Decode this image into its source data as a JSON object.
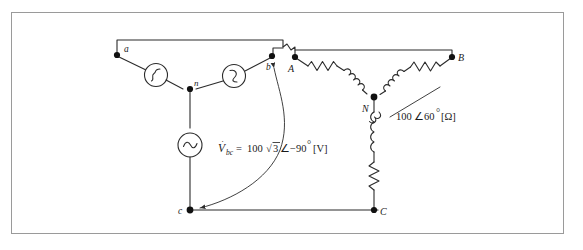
{
  "figure": {
    "type": "electrical-circuit-schematic",
    "corner_note": ""
  },
  "source_side": {
    "nodes": [
      {
        "id": "a",
        "label": "a"
      },
      {
        "id": "b",
        "label": "b"
      },
      {
        "id": "c",
        "label": "c"
      },
      {
        "id": "n",
        "label": "n"
      }
    ],
    "sources": [
      {
        "name": "source-a-n",
        "symbol": "ac-source"
      },
      {
        "name": "source-b-n",
        "symbol": "ac-source"
      },
      {
        "name": "source-c-n",
        "symbol": "ac-sine-source"
      }
    ],
    "voltage_label": "V̇bc = 100√3∠−90° [V]",
    "voltage_parts": {
      "symbol": "V",
      "dot": "̇",
      "subscript": "bc",
      "equals": "=",
      "magnitude": "100",
      "radical": "√",
      "radicand": "3",
      "angle_sign": "∠",
      "angle": "−90",
      "degree": "°",
      "unit": "[V]"
    }
  },
  "load_side": {
    "nodes": [
      {
        "id": "A",
        "label": "A"
      },
      {
        "id": "B",
        "label": "B"
      },
      {
        "id": "C",
        "label": "C"
      },
      {
        "id": "N",
        "label": "N"
      }
    ],
    "branches": [
      {
        "name": "branch-N-A",
        "elements": [
          "inductor",
          "resistor"
        ]
      },
      {
        "name": "branch-N-B",
        "elements": [
          "inductor",
          "resistor"
        ]
      },
      {
        "name": "branch-N-C",
        "elements": [
          "inductor",
          "resistor"
        ]
      }
    ],
    "impedance_label": "100∠60°[Ω]",
    "impedance_parts": {
      "magnitude": "100",
      "angle_sign": "∠",
      "angle": "60",
      "degree": "°",
      "unit": "[Ω]"
    }
  },
  "annotations": {
    "vbc_arrow": {
      "name": "vbc-measurement-arrow",
      "from": "b",
      "to": "c",
      "style": "double-headed-curve"
    }
  },
  "colors": {
    "wire": "#2b2b2b",
    "node": "#111111",
    "border": "#9a9a9a",
    "background": "#ffffff",
    "text": "#1a1a1a"
  }
}
